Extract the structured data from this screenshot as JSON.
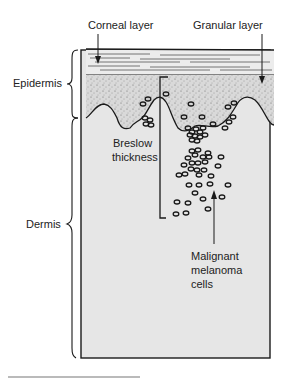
{
  "diagram": {
    "labels": {
      "corneal_layer": "Corneal layer",
      "granular_layer": "Granular layer",
      "epidermis": "Epidermis",
      "dermis": "Dermis",
      "breslow_line1": "Breslow",
      "breslow_line2": "thickness",
      "melanoma_line1": "Malignant",
      "melanoma_line2": "melanoma",
      "melanoma_line3": "cells"
    },
    "colors": {
      "dermis_fill": "#e6e6e6",
      "epidermis_fill": "#d6d6d6",
      "corneal_fill": "#e9e9e9",
      "ink": "#1a1a1a"
    }
  }
}
